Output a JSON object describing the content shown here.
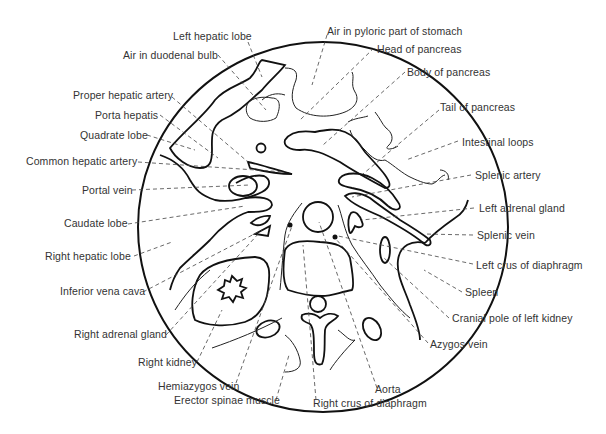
{
  "figure": {
    "type": "Axial cross-section schematic of upper abdomen",
    "labels_left": [
      {
        "id": "left-hepatic-lobe",
        "text": "Left hepatic lobe",
        "x": 173,
        "y": 30
      },
      {
        "id": "air-in-duodenal-bulb",
        "text": "Air in duodenal bulb",
        "x": 123,
        "y": 49
      },
      {
        "id": "proper-hepatic-artery",
        "text": "Proper hepatic artery",
        "x": 73,
        "y": 89
      },
      {
        "id": "porta-hepatis",
        "text": "Porta hepatis",
        "x": 95,
        "y": 109
      },
      {
        "id": "quadrate-lobe",
        "text": "Quadrate lobe",
        "x": 80,
        "y": 129
      },
      {
        "id": "common-hepatic-artery",
        "text": "Common hepatic artery",
        "x": 26,
        "y": 155
      },
      {
        "id": "portal-vein",
        "text": "Portal vein",
        "x": 82,
        "y": 184
      },
      {
        "id": "caudate-lobe",
        "text": "Caudate lobe",
        "x": 64,
        "y": 217
      },
      {
        "id": "right-hepatic-lobe",
        "text": "Right hepatic lobe",
        "x": 45,
        "y": 250
      },
      {
        "id": "inferior-vena-cava",
        "text": "Inferior vena cava",
        "x": 60,
        "y": 285
      },
      {
        "id": "right-adrenal-gland",
        "text": "Right adrenal gland",
        "x": 74,
        "y": 328
      },
      {
        "id": "right-kidney",
        "text": "Right kidney",
        "x": 138,
        "y": 356
      },
      {
        "id": "hemiazygos-vein",
        "text": "Hemiazygos vein",
        "x": 158,
        "y": 380
      },
      {
        "id": "erector-spinae-muscle",
        "text": "Erector spinae muscle",
        "x": 174,
        "y": 394
      }
    ],
    "labels_right": [
      {
        "id": "air-in-pyloric-part-of-stomach",
        "text": "Air in pyloric part of stomach",
        "x": 327,
        "y": 25
      },
      {
        "id": "head-of-pancreas",
        "text": "Head of pancreas",
        "x": 377,
        "y": 43
      },
      {
        "id": "body-of-pancreas",
        "text": "Body of pancreas",
        "x": 407,
        "y": 66
      },
      {
        "id": "tail-of-pancreas",
        "text": "Tail of pancreas",
        "x": 440,
        "y": 101
      },
      {
        "id": "intestinal-loops",
        "text": "Intestinal loops",
        "x": 462,
        "y": 136
      },
      {
        "id": "splenic-artery",
        "text": "Splenic artery",
        "x": 475,
        "y": 169
      },
      {
        "id": "left-adrenal-gland",
        "text": "Left adrenal gland",
        "x": 479,
        "y": 202
      },
      {
        "id": "splenic-vein",
        "text": "Splenic vein",
        "x": 477,
        "y": 229
      },
      {
        "id": "left-crus-of-diaphragm",
        "text": "Left crus of diaphragm",
        "x": 476,
        "y": 259
      },
      {
        "id": "spleen",
        "text": "Spleen",
        "x": 465,
        "y": 286
      },
      {
        "id": "cranial-pole-of-left-kidney",
        "text": "Cranial pole of left kidney",
        "x": 452,
        "y": 312
      },
      {
        "id": "azygos-vein",
        "text": "Azygos vein",
        "x": 430,
        "y": 338
      },
      {
        "id": "aorta",
        "text": "Aorta",
        "x": 375,
        "y": 383
      },
      {
        "id": "right-crus-of-diaphragm",
        "text": "Right crus of diaphragm",
        "x": 313,
        "y": 397
      }
    ]
  }
}
